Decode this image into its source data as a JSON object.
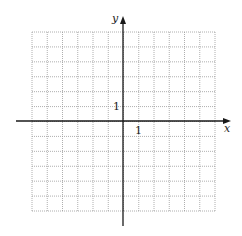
{
  "diagram": {
    "type": "coordinate-grid",
    "grid": {
      "columns": 12,
      "rows": 12,
      "x_min": -6,
      "x_max": 6,
      "y_min": -6,
      "y_max": 6,
      "line_style": "dotted",
      "line_color": "#9a9a9a"
    },
    "axes": {
      "x_label": "x",
      "y_label": "y",
      "color": "#1a1a1a"
    },
    "tick_labels": {
      "x_unit": "1",
      "y_unit": "1"
    }
  }
}
